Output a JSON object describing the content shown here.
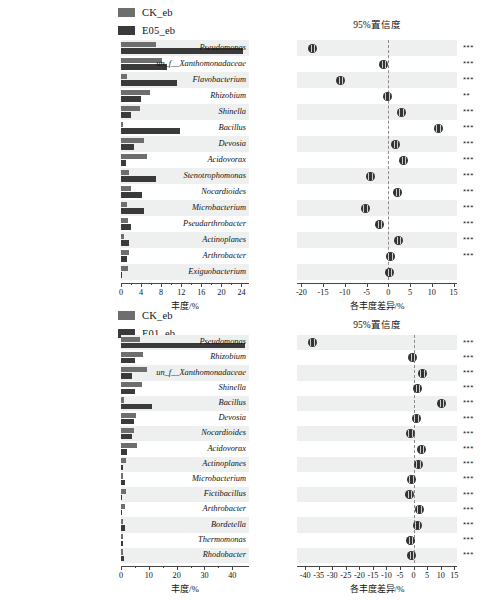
{
  "figure": {
    "panels": [
      {
        "id": "top",
        "legend": [
          {
            "label": "CK_eb",
            "color": "#6e6e6e"
          },
          {
            "label": "E05_eb",
            "color": "#3a3a3a"
          }
        ],
        "ci_title": "95%置信度",
        "abundance_axis_title": "丰度/%",
        "difference_axis_title": "各丰度差异/%",
        "chart_data": {
          "type": "bar",
          "title": "",
          "xlabel": "丰度/%",
          "ylabel": "",
          "xlim": [
            0,
            25.5
          ],
          "xticks": [
            0,
            4,
            8,
            12,
            16,
            20,
            24
          ],
          "xticklabels": [
            "0",
            "4",
            "8",
            "12",
            "16",
            "20",
            "24"
          ],
          "grid": false,
          "legend_position": "top",
          "categories": [
            "Pseudomonas",
            "un_f__Xanthomonadaceae",
            "Flavobacterium",
            "Rhizobium",
            "Shinella",
            "Bacillus",
            "Devosia",
            "Acidovorax",
            "Stenotrophomonas",
            "Nocardioides",
            "Microbacterium",
            "Pseudarthrobacter",
            "Actinoplanes",
            "Arthrobacter",
            "Exiguobacterium"
          ],
          "series": [
            {
              "name": "CK_eb",
              "color": "#6e6e6e",
              "values": [
                7.0,
                8.1,
                1.1,
                5.8,
                3.8,
                0.3,
                4.6,
                5.2,
                1.5,
                2.0,
                1.2,
                1.3,
                0.5,
                1.5,
                1.4
              ]
            },
            {
              "name": "E05_eb",
              "color": "#3a3a3a",
              "values": [
                24.4,
                9.2,
                11.2,
                4.0,
                1.9,
                11.8,
                2.6,
                0.9,
                6.9,
                4.2,
                4.5,
                1.9,
                1.6,
                1.1,
                0.2
              ]
            }
          ]
        },
        "ci_data": {
          "type": "scatter",
          "xlabel": "各丰度差异/%",
          "xlim": [
            -21,
            15.8
          ],
          "xticks": [
            -20,
            -15,
            -10,
            -5,
            0,
            5,
            10,
            15
          ],
          "xticklabels": [
            "-20",
            "-15",
            "-10",
            "-5",
            "0",
            "5",
            "10",
            "15"
          ],
          "zero_reference": 0,
          "points": [
            {
              "category": "Pseudomonas",
              "diff": -17.4,
              "ci_low": -17.9,
              "ci_high": -16.9,
              "significance": "***"
            },
            {
              "category": "un_f__Xanthomonadaceae",
              "diff": -1.1,
              "ci_low": -1.6,
              "ci_high": -0.6,
              "significance": "***"
            },
            {
              "category": "Flavobacterium",
              "diff": -10.9,
              "ci_low": -11.4,
              "ci_high": -10.4,
              "significance": "***"
            },
            {
              "category": "Rhizobium",
              "diff": -0.3,
              "ci_low": -0.8,
              "ci_high": 0.2,
              "significance": "**"
            },
            {
              "category": "Shinella",
              "diff": 3.0,
              "ci_low": 2.5,
              "ci_high": 3.5,
              "significance": "***"
            },
            {
              "category": "Bacillus",
              "diff": 11.5,
              "ci_low": 11.0,
              "ci_high": 12.0,
              "significance": "***"
            },
            {
              "category": "Devosia",
              "diff": 1.7,
              "ci_low": 1.2,
              "ci_high": 2.2,
              "significance": "***"
            },
            {
              "category": "Acidovorax",
              "diff": 3.5,
              "ci_low": 3.0,
              "ci_high": 4.0,
              "significance": "***"
            },
            {
              "category": "Stenotrophomonas",
              "diff": -4.2,
              "ci_low": -4.7,
              "ci_high": -3.7,
              "significance": "***"
            },
            {
              "category": "Nocardioides",
              "diff": 2.2,
              "ci_low": 1.7,
              "ci_high": 2.7,
              "significance": "***"
            },
            {
              "category": "Microbacterium",
              "diff": -5.3,
              "ci_low": -5.8,
              "ci_high": -4.8,
              "significance": "***"
            },
            {
              "category": "Pseudarthrobacter",
              "diff": -2.0,
              "ci_low": -2.5,
              "ci_high": -1.5,
              "significance": "***"
            },
            {
              "category": "Actinoplanes",
              "diff": 2.4,
              "ci_low": 1.9,
              "ci_high": 2.9,
              "significance": "***"
            },
            {
              "category": "Arthrobacter",
              "diff": 0.4,
              "ci_low": -0.1,
              "ci_high": 0.9,
              "significance": "***"
            },
            {
              "category": "Exiguobacterium",
              "diff": 0.3,
              "ci_low": -0.2,
              "ci_high": 0.8,
              "significance": ""
            }
          ]
        }
      },
      {
        "id": "bottom",
        "legend": [
          {
            "label": "CK_eb",
            "color": "#6e6e6e"
          },
          {
            "label": "E01_eb",
            "color": "#3a3a3a"
          }
        ],
        "ci_title": "95%置信度",
        "abundance_axis_title": "丰度/%",
        "difference_axis_title": "各丰度差异/%",
        "chart_data": {
          "type": "bar",
          "title": "",
          "xlabel": "丰度/%",
          "ylabel": "",
          "xlim": [
            0,
            46
          ],
          "xticks": [
            0,
            10,
            20,
            30,
            40
          ],
          "xticklabels": [
            "0",
            "10",
            "20",
            "30",
            "40"
          ],
          "grid": false,
          "legend_position": "top",
          "categories": [
            "Pseudomonas",
            "Rhizobium",
            "un_f__Xanthomonadaceae",
            "Shinella",
            "Bacillus",
            "Devosia",
            "Nocardioides",
            "Acidovorax",
            "Actinoplanes",
            "Microbacterium",
            "Fictibacillus",
            "Arthrobacter",
            "Bordetella",
            "Thermomonas",
            "Rhodobacter"
          ],
          "series": [
            {
              "name": "CK_eb",
              "color": "#6e6e6e",
              "values": [
                7.0,
                7.9,
                9.4,
                7.6,
                1.0,
                5.5,
                4.5,
                5.7,
                1.9,
                0.8,
                1.7,
                1.6,
                0.8,
                0.8,
                0.7
              ]
            },
            {
              "name": "E01_eb",
              "color": "#3a3a3a",
              "values": [
                44.6,
                5.0,
                4.1,
                5.1,
                11.3,
                4.6,
                4.1,
                2.0,
                0.6,
                1.4,
                0.5,
                0.5,
                1.6,
                0.8,
                1.0
              ]
            }
          ]
        },
        "ci_data": {
          "type": "scatter",
          "xlabel": "各丰度差异/%",
          "xlim": [
            -43,
            16
          ],
          "xticks": [
            -40,
            -35,
            -30,
            -25,
            -20,
            -15,
            -10,
            -5,
            0,
            5,
            10,
            15
          ],
          "xticklabels": [
            "-40",
            "-35",
            "-30",
            "-25",
            "-20",
            "-15",
            "-10",
            "-5",
            "0",
            "5",
            "10",
            "15"
          ],
          "zero_reference": 0,
          "points": [
            {
              "category": "Pseudomonas",
              "diff": -37.3,
              "ci_low": -37.8,
              "ci_high": -36.8,
              "significance": "***"
            },
            {
              "category": "Rhizobium",
              "diff": -0.4,
              "ci_low": -0.9,
              "ci_high": 0.1,
              "significance": "***"
            },
            {
              "category": "un_f__Xanthomonadaceae",
              "diff": 3.1,
              "ci_low": 2.6,
              "ci_high": 3.6,
              "significance": "***"
            },
            {
              "category": "Shinella",
              "diff": 1.6,
              "ci_low": 1.1,
              "ci_high": 2.1,
              "significance": "***"
            },
            {
              "category": "Bacillus",
              "diff": 10.3,
              "ci_low": 9.8,
              "ci_high": 10.8,
              "significance": "***"
            },
            {
              "category": "Devosia",
              "diff": 1.0,
              "ci_low": 0.5,
              "ci_high": 1.5,
              "significance": "***"
            },
            {
              "category": "Nocardioides",
              "diff": -1.2,
              "ci_low": -1.7,
              "ci_high": -0.7,
              "significance": "***"
            },
            {
              "category": "Acidovorax",
              "diff": 3.0,
              "ci_low": 2.5,
              "ci_high": 3.5,
              "significance": "***"
            },
            {
              "category": "Actinoplanes",
              "diff": 1.7,
              "ci_low": 1.2,
              "ci_high": 2.2,
              "significance": "***"
            },
            {
              "category": "Microbacterium",
              "diff": -0.9,
              "ci_low": -1.4,
              "ci_high": -0.4,
              "significance": "***"
            },
            {
              "category": "Fictibacillus",
              "diff": -1.5,
              "ci_low": -2.0,
              "ci_high": -1.0,
              "significance": "***"
            },
            {
              "category": "Arthrobacter",
              "diff": 2.1,
              "ci_low": 1.6,
              "ci_high": 2.6,
              "significance": "***"
            },
            {
              "category": "Bordetella",
              "diff": 1.4,
              "ci_low": 0.9,
              "ci_high": 1.9,
              "significance": "***"
            },
            {
              "category": "Thermomonas",
              "diff": -1.1,
              "ci_low": -1.6,
              "ci_high": -0.6,
              "significance": "***"
            },
            {
              "category": "Rhodobacter",
              "diff": -0.6,
              "ci_low": -1.1,
              "ci_high": -0.1,
              "significance": "***"
            }
          ]
        }
      }
    ]
  }
}
